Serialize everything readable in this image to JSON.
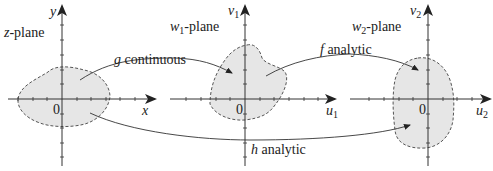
{
  "planes": [
    {
      "name": "z-plane",
      "var": "z",
      "title_suffix": "-plane",
      "h_axis": "x",
      "v_axis": "y",
      "origin": "0"
    },
    {
      "name": "w1-plane",
      "var": "w",
      "var_sub": "1",
      "title_suffix": "-plane",
      "h_axis": "u",
      "h_sub": "1",
      "v_axis": "v",
      "v_sub": "1",
      "origin": "0"
    },
    {
      "name": "w2-plane",
      "var": "w",
      "var_sub": "2",
      "title_suffix": "-plane",
      "h_axis": "u",
      "h_sub": "2",
      "v_axis": "v",
      "v_sub": "2",
      "origin": "0"
    }
  ],
  "mappings": [
    {
      "fn": "g",
      "label": " continuous",
      "from": "z-plane",
      "to": "w1-plane"
    },
    {
      "fn": "f",
      "label": " analytic",
      "from": "w1-plane",
      "to": "w2-plane"
    },
    {
      "fn": "h",
      "label": " analytic",
      "from": "z-plane",
      "to": "w2-plane"
    }
  ],
  "colors": {
    "region_fill": "#e6e6e6",
    "region_border": "#555555",
    "axis": "#333333"
  }
}
